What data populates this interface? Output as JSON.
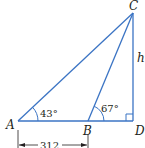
{
  "diagram": {
    "type": "triangle",
    "colors": {
      "line": "#3b74c4",
      "text": "#231f20",
      "background": "#ffffff"
    },
    "points": {
      "A": {
        "label": "A",
        "x": 18,
        "y": 121
      },
      "B": {
        "label": "B",
        "x": 88,
        "y": 121
      },
      "C": {
        "label": "C",
        "x": 133,
        "y": 13
      },
      "D": {
        "label": "D",
        "x": 133,
        "y": 121
      }
    },
    "angles": {
      "A": "43°",
      "B": "67°",
      "D": "right-angle"
    },
    "side_labels": {
      "CD": "h",
      "AB": "312"
    }
  }
}
